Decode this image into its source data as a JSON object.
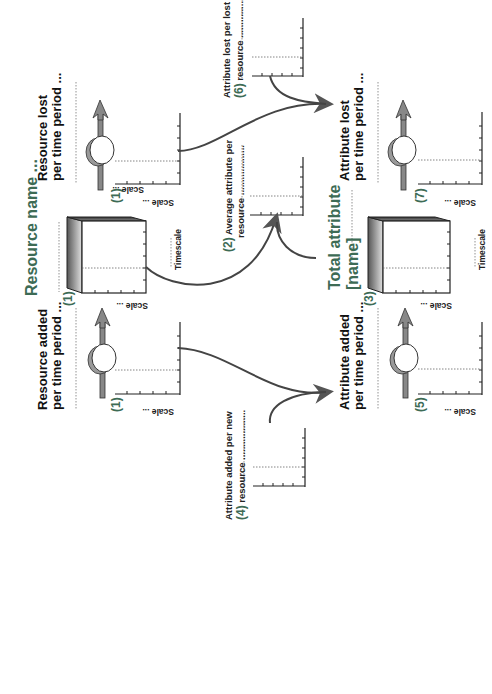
{
  "diagram": {
    "resource_name": "Resource name ...",
    "total_attribute_line1": "Total attribute",
    "total_attribute_line2": "[name]",
    "resource_lost": {
      "line1": "Resource lost",
      "line2": "per time period ...",
      "number": "(1)",
      "scale": "Scale ..."
    },
    "resource_added": {
      "line1": "Resource added",
      "line2": "per time period ...",
      "number": "(1)",
      "scale": "Scale ..."
    },
    "resource_stock": {
      "number": "(1)",
      "scale": "Scale ...",
      "timescale": "Timescale"
    },
    "average_attribute": {
      "number": "(2)",
      "line1": "Average attribute per",
      "line2": "resource ..................."
    },
    "total_stock": {
      "number": "(3)",
      "scale": "Scale ...",
      "timescale": "Timescale"
    },
    "attribute_added_per_new": {
      "number": "(4)",
      "line1": "Attribute added per new",
      "line2": "resource ..................."
    },
    "attribute_added": {
      "line1": "Attribute  added",
      "line2": "per time period ...",
      "number": "(5)",
      "scale": "Scale ..."
    },
    "attribute_lost_per_lost": {
      "number": "(6)",
      "line1": "Attribute lost per lost",
      "line2": "resource ..................."
    },
    "attribute_lost": {
      "line1": "Attribute lost",
      "line2": "per time period ...",
      "number": "(7)",
      "scale": "Scale ..."
    },
    "colors": {
      "label_green": "#3d6b55",
      "arrow_gray": "#808080",
      "line": "#444444"
    }
  }
}
